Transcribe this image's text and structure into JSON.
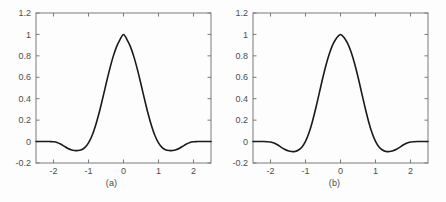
{
  "figure": {
    "background_color": "#fdfdfd",
    "axis_color": "#7a7a7a",
    "curve_color": "#1a1a1a",
    "text_color": "#4d4d4d"
  },
  "panels": [
    {
      "caption": "(a)",
      "box": {
        "left": 36,
        "top": 13,
        "right": 211,
        "bottom": 163
      }
    },
    {
      "caption": "(b)",
      "box": {
        "left": 30,
        "top": 13,
        "right": 205,
        "bottom": 163
      }
    }
  ],
  "chart_data": [
    {
      "type": "line",
      "title": "",
      "subtitle": "",
      "caption": "(a)",
      "xlabel": "",
      "ylabel": "",
      "xlim": [
        -2.5,
        2.5
      ],
      "ylim": [
        -0.2,
        1.2
      ],
      "xticks": [
        -2,
        -1,
        0,
        1,
        2
      ],
      "xtick_labels": [
        "-2",
        "-1",
        "0",
        "1",
        "2"
      ],
      "yticks": [
        -0.2,
        0,
        0.2,
        0.4,
        0.6,
        0.8,
        1,
        1.2
      ],
      "ytick_labels": [
        "-0.2",
        "0",
        "0.2",
        "0.4",
        "0.6",
        "0.8",
        "1",
        "1.2"
      ],
      "grid": false,
      "legend": null,
      "series": [
        {
          "name": "scaling function (a)",
          "x": [
            -2.5,
            -2.4,
            -2.3,
            -2.2,
            -2.1,
            -2.0,
            -1.9,
            -1.8,
            -1.7,
            -1.6,
            -1.5,
            -1.4,
            -1.3,
            -1.2,
            -1.1,
            -1.0,
            -0.9,
            -0.8,
            -0.7,
            -0.6,
            -0.5,
            -0.4,
            -0.3,
            -0.2,
            -0.1,
            0.0,
            0.1,
            0.2,
            0.3,
            0.4,
            0.5,
            0.6,
            0.7,
            0.8,
            0.9,
            1.0,
            1.1,
            1.2,
            1.3,
            1.4,
            1.5,
            1.6,
            1.7,
            1.8,
            1.9,
            2.0,
            2.1,
            2.2,
            2.3,
            2.4,
            2.5
          ],
          "y": [
            0.0,
            0.0,
            0.0,
            0.0,
            0.0,
            -0.002,
            -0.008,
            -0.022,
            -0.042,
            -0.062,
            -0.076,
            -0.083,
            -0.084,
            -0.076,
            -0.054,
            -0.012,
            0.055,
            0.148,
            0.264,
            0.396,
            0.535,
            0.669,
            0.788,
            0.884,
            0.952,
            1.0,
            0.952,
            0.884,
            0.788,
            0.669,
            0.535,
            0.396,
            0.264,
            0.148,
            0.055,
            -0.012,
            -0.054,
            -0.076,
            -0.084,
            -0.083,
            -0.076,
            -0.062,
            -0.042,
            -0.022,
            -0.008,
            -0.002,
            0.0,
            0.0,
            0.0,
            0.0,
            0.0
          ]
        }
      ],
      "annotations": {
        "peak_value": 1.0,
        "peak_x": 0.0,
        "trough_value": -0.084,
        "trough_x": [
          -1.3,
          1.3
        ],
        "zero_crossings": [
          -1.02,
          1.02
        ]
      }
    },
    {
      "type": "line",
      "title": "",
      "subtitle": "",
      "caption": "(b)",
      "xlabel": "",
      "ylabel": "",
      "xlim": [
        -2.5,
        2.5
      ],
      "ylim": [
        -0.2,
        1.2
      ],
      "xticks": [
        -2,
        -1,
        0,
        1,
        2
      ],
      "xtick_labels": [
        "-2",
        "-1",
        "0",
        "1",
        "2"
      ],
      "yticks": [
        -0.2,
        0,
        0.2,
        0.4,
        0.6,
        0.8,
        1,
        1.2
      ],
      "ytick_labels": [
        "-0.2",
        "0",
        "0.2",
        "0.4",
        "0.6",
        "0.8",
        "1",
        "1.2"
      ],
      "grid": false,
      "legend": null,
      "series": [
        {
          "name": "scaling function (b)",
          "x": [
            -2.5,
            -2.4,
            -2.3,
            -2.2,
            -2.1,
            -2.0,
            -1.9,
            -1.8,
            -1.7,
            -1.6,
            -1.5,
            -1.4,
            -1.3,
            -1.2,
            -1.1,
            -1.0,
            -0.9,
            -0.8,
            -0.7,
            -0.6,
            -0.5,
            -0.4,
            -0.3,
            -0.2,
            -0.1,
            0.0,
            0.1,
            0.2,
            0.3,
            0.4,
            0.5,
            0.6,
            0.7,
            0.8,
            0.9,
            1.0,
            1.1,
            1.2,
            1.3,
            1.4,
            1.5,
            1.6,
            1.7,
            1.8,
            1.9,
            2.0,
            2.1,
            2.2,
            2.3,
            2.4,
            2.5
          ],
          "y": [
            0.0,
            0.0,
            0.0,
            0.0,
            -0.001,
            -0.004,
            -0.013,
            -0.03,
            -0.052,
            -0.072,
            -0.086,
            -0.093,
            -0.092,
            -0.079,
            -0.05,
            0.002,
            0.082,
            0.19,
            0.32,
            0.462,
            0.603,
            0.731,
            0.838,
            0.918,
            0.972,
            1.0,
            0.972,
            0.918,
            0.838,
            0.731,
            0.603,
            0.462,
            0.32,
            0.19,
            0.082,
            0.002,
            -0.05,
            -0.079,
            -0.092,
            -0.093,
            -0.086,
            -0.072,
            -0.052,
            -0.03,
            -0.013,
            -0.004,
            -0.001,
            0.0,
            0.0,
            0.0,
            0.0
          ]
        }
      ],
      "annotations": {
        "peak_value": 1.0,
        "peak_x": 0.0,
        "trough_value": -0.093,
        "trough_x": [
          -1.35,
          1.35
        ],
        "zero_crossings": [
          -1.0,
          1.0
        ]
      }
    }
  ]
}
